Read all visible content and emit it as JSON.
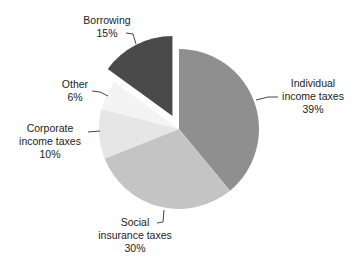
{
  "chart_data": {
    "type": "pie",
    "title": "",
    "categories": [
      "Individual income taxes",
      "Social insurance taxes",
      "Corporate income taxes",
      "Other",
      "Borrowing"
    ],
    "values": [
      39,
      30,
      10,
      6,
      15
    ],
    "unit": "%",
    "exploded": [
      "Borrowing"
    ],
    "colors": [
      "#8f8f8f",
      "#c4c4c4",
      "#e6e6e6",
      "#f4f4f4",
      "#4a4a4a"
    ],
    "legend": "none (direct labels with leader lines)"
  },
  "labels": {
    "individual": {
      "line1": "Individual",
      "line2": "income taxes",
      "pct": "39%"
    },
    "social": {
      "line1": "Social",
      "line2": "insurance taxes",
      "pct": "30%"
    },
    "corporate": {
      "line1": "Corporate",
      "line2": "income taxes",
      "pct": "10%"
    },
    "other": {
      "line1": "Other",
      "pct": "6%"
    },
    "borrowing": {
      "line1": "Borrowing",
      "pct": "15%"
    }
  }
}
